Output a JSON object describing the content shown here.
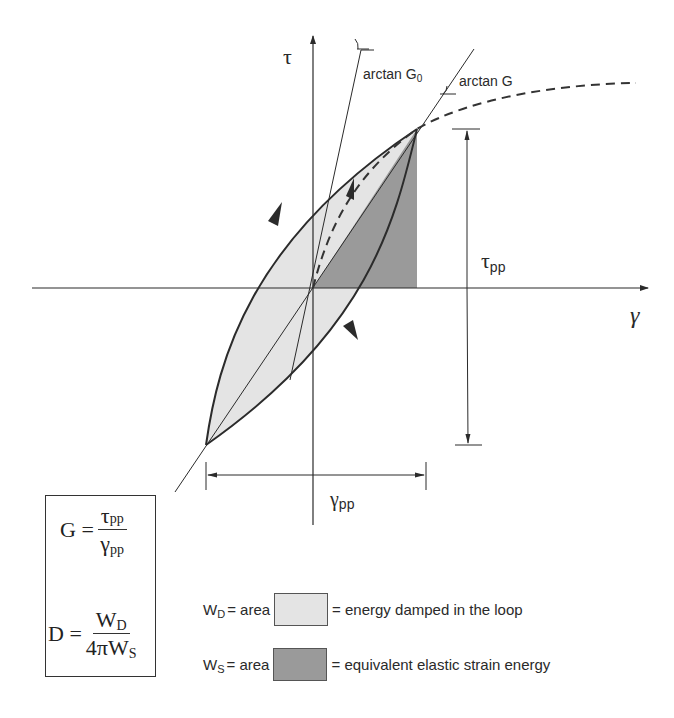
{
  "diagram": {
    "axes": {
      "y_label": "τ",
      "x_label": "γ"
    },
    "annotations": {
      "arctan_g0": {
        "text": "arctan G",
        "subscript": "0"
      },
      "arctan_g": {
        "text": "arctan G"
      },
      "tau_pp": {
        "symbol": "τ",
        "subscript": "pp"
      },
      "gamma_pp": {
        "symbol": "γ",
        "subscript": "pp"
      }
    },
    "formulas": {
      "G": {
        "lhs": "G =",
        "num_symbol": "τ",
        "num_sub": "pp",
        "den_symbol": "γ",
        "den_sub": "pp"
      },
      "D": {
        "lhs": "D =",
        "num_symbol": "W",
        "num_sub": "D",
        "den_symbol": "4πW",
        "den_sub": "S"
      }
    },
    "legend": [
      {
        "symbol": "W",
        "subscript": "D",
        "eq": "= area",
        "description": "= energy damped in the loop",
        "color": "#e4e4e4"
      },
      {
        "symbol": "W",
        "subscript": "S",
        "eq": "= area",
        "description": "= equivalent elastic strain energy",
        "color": "#9a9a9a"
      }
    ],
    "colors": {
      "line": "#2b2b2b",
      "light_fill": "#e4e4e4",
      "dark_fill": "#9a9a9a",
      "background": "#ffffff"
    },
    "geometry": {
      "origin": [
        313,
        288
      ],
      "peak": [
        417,
        129
      ],
      "trough": [
        206,
        445
      ]
    }
  }
}
